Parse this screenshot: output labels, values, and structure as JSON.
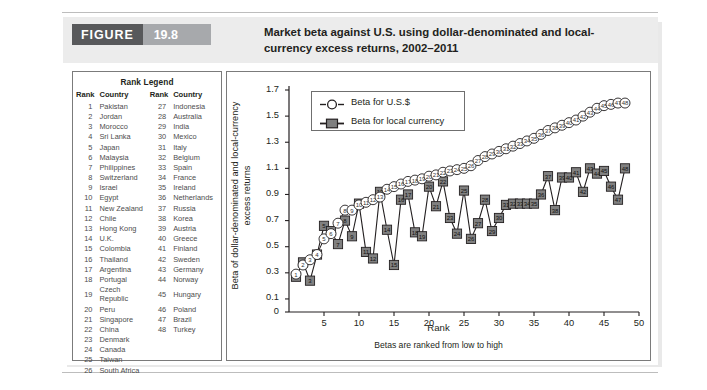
{
  "figure": {
    "badge_word": "FIGURE",
    "badge_number": "19.8",
    "title": "Market beta against U.S. using dollar-denominated and local-currency excess returns, 2002–2011"
  },
  "rank_legend": {
    "title": "Rank Legend",
    "headers": [
      "Rank",
      "Country",
      "Rank",
      "Country"
    ],
    "left": [
      {
        "rank": "1",
        "country": "Pakistan"
      },
      {
        "rank": "2",
        "country": "Jordan"
      },
      {
        "rank": "3",
        "country": "Morocco"
      },
      {
        "rank": "4",
        "country": "Sri Lanka"
      },
      {
        "rank": "5",
        "country": "Japan"
      },
      {
        "rank": "6",
        "country": "Malaysia"
      },
      {
        "rank": "7",
        "country": "Philippines"
      },
      {
        "rank": "8",
        "country": "Switzerland"
      },
      {
        "rank": "9",
        "country": "Israel"
      },
      {
        "rank": "10",
        "country": "Egypt"
      },
      {
        "rank": "11",
        "country": "New Zealand"
      },
      {
        "rank": "12",
        "country": "Chile"
      },
      {
        "rank": "13",
        "country": "Hong Kong"
      },
      {
        "rank": "14",
        "country": "U.K."
      },
      {
        "rank": "15",
        "country": "Colombia"
      },
      {
        "rank": "16",
        "country": "Thailand"
      },
      {
        "rank": "17",
        "country": "Argentina"
      },
      {
        "rank": "18",
        "country": "Portugal"
      },
      {
        "rank": "19",
        "country": "Czech Republic"
      },
      {
        "rank": "20",
        "country": "Peru"
      },
      {
        "rank": "21",
        "country": "Singapore"
      },
      {
        "rank": "22",
        "country": "China"
      },
      {
        "rank": "23",
        "country": "Denmark"
      },
      {
        "rank": "24",
        "country": "Canada"
      },
      {
        "rank": "25",
        "country": "Taiwan"
      },
      {
        "rank": "26",
        "country": "South Africa"
      }
    ],
    "right": [
      {
        "rank": "27",
        "country": "Indonesia"
      },
      {
        "rank": "28",
        "country": "Australia"
      },
      {
        "rank": "29",
        "country": "India"
      },
      {
        "rank": "30",
        "country": "Mexico"
      },
      {
        "rank": "31",
        "country": "Italy"
      },
      {
        "rank": "32",
        "country": "Belgium"
      },
      {
        "rank": "33",
        "country": "Spain"
      },
      {
        "rank": "34",
        "country": "France"
      },
      {
        "rank": "35",
        "country": "Ireland"
      },
      {
        "rank": "36",
        "country": "Netherlands"
      },
      {
        "rank": "37",
        "country": "Russia"
      },
      {
        "rank": "38",
        "country": "Korea"
      },
      {
        "rank": "39",
        "country": "Austria"
      },
      {
        "rank": "40",
        "country": "Greece"
      },
      {
        "rank": "41",
        "country": "Finland"
      },
      {
        "rank": "42",
        "country": "Sweden"
      },
      {
        "rank": "43",
        "country": "Germany"
      },
      {
        "rank": "44",
        "country": "Norway"
      },
      {
        "rank": "45",
        "country": "Hungary"
      },
      {
        "rank": "46",
        "country": "Poland"
      },
      {
        "rank": "47",
        "country": "Brazil"
      },
      {
        "rank": "48",
        "country": "Turkey"
      }
    ]
  },
  "chart_data": {
    "type": "line",
    "title": "",
    "xlabel": "Rank",
    "xsublabel": "Betas are ranked from low to high",
    "ylabel": "Beta of dollar-denominated and local-currency excess returns",
    "xlim": [
      0,
      50
    ],
    "ylim": [
      0,
      1.7
    ],
    "xticks": [
      5,
      10,
      15,
      20,
      25,
      30,
      35,
      40,
      45,
      50
    ],
    "yticks": [
      0,
      0.1,
      0.3,
      0.5,
      0.7,
      0.9,
      1.1,
      1.3,
      1.5,
      1.7
    ],
    "grid": false,
    "legend_position": "top-left",
    "marker_labels": "rank number inside each marker",
    "x": [
      1,
      2,
      3,
      4,
      5,
      6,
      7,
      8,
      9,
      10,
      11,
      12,
      13,
      14,
      15,
      16,
      17,
      18,
      19,
      20,
      21,
      22,
      23,
      24,
      25,
      26,
      27,
      28,
      29,
      30,
      31,
      32,
      33,
      34,
      35,
      36,
      37,
      38,
      39,
      40,
      41,
      42,
      43,
      44,
      45,
      46,
      47,
      48
    ],
    "series": [
      {
        "name": "Beta for U.S.$",
        "marker": "open-circle",
        "color": "#ffffff",
        "edge_color": "#231f20",
        "values": [
          0.29,
          0.36,
          0.4,
          0.44,
          0.56,
          0.6,
          0.68,
          0.78,
          0.78,
          0.82,
          0.84,
          0.86,
          0.88,
          0.94,
          0.96,
          0.98,
          1.0,
          1.01,
          1.02,
          1.04,
          1.05,
          1.07,
          1.08,
          1.09,
          1.1,
          1.12,
          1.16,
          1.19,
          1.21,
          1.23,
          1.25,
          1.27,
          1.29,
          1.31,
          1.33,
          1.36,
          1.39,
          1.41,
          1.43,
          1.45,
          1.47,
          1.5,
          1.53,
          1.56,
          1.58,
          1.59,
          1.6,
          1.6
        ]
      },
      {
        "name": "Beta for local currency",
        "marker": "filled-square",
        "color": "#808080",
        "edge_color": "#231f20",
        "values": [
          0.27,
          0.38,
          0.24,
          0.44,
          0.66,
          0.62,
          0.52,
          0.7,
          0.58,
          0.83,
          0.46,
          0.41,
          0.92,
          0.63,
          0.36,
          0.86,
          0.9,
          0.61,
          0.58,
          0.96,
          0.81,
          1.0,
          0.72,
          0.6,
          0.93,
          0.56,
          0.68,
          0.86,
          0.62,
          0.72,
          0.82,
          0.83,
          0.83,
          0.83,
          0.83,
          0.9,
          1.04,
          0.78,
          1.03,
          1.03,
          1.07,
          0.92,
          1.1,
          1.06,
          1.08,
          0.96,
          0.86,
          1.1
        ]
      }
    ]
  },
  "chart_legend": {
    "items": [
      {
        "label": "Beta for U.S.$",
        "marker": "open-circle"
      },
      {
        "label": "Beta for local currency",
        "marker": "filled-square"
      }
    ]
  }
}
